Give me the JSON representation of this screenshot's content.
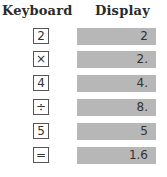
{
  "headers": {
    "keyboard": "Keyboard",
    "display": "Display"
  },
  "rows": [
    {
      "key": "2",
      "display": "2"
    },
    {
      "key": "×",
      "display": "2."
    },
    {
      "key": "4",
      "display": "4."
    },
    {
      "key": "÷",
      "display": "8."
    },
    {
      "key": "5",
      "display": "5"
    },
    {
      "key": "=",
      "display": "1.6"
    }
  ],
  "colors": {
    "display_bg": "#b7b7b7",
    "key_border": "#555555"
  }
}
